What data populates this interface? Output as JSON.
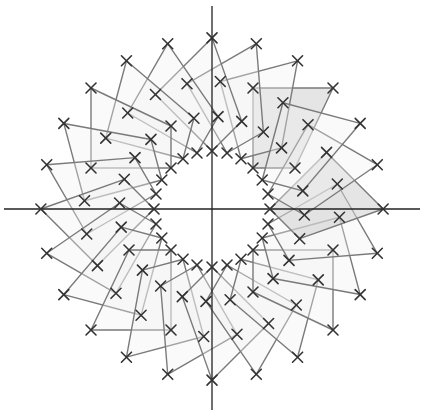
{
  "figure": {
    "origin_px": [
      212,
      209
    ],
    "axes": {
      "x_axis": {
        "from": [
          4,
          209
        ],
        "to": [
          420,
          209
        ]
      },
      "y_axis": {
        "from": [
          212,
          6
        ],
        "to": [
          212,
          410
        ]
      }
    },
    "base_shape": {
      "vertices": [
        [
          41,
          41
        ],
        [
          83,
          41
        ],
        [
          121,
          121
        ],
        [
          41,
          121
        ]
      ]
    },
    "rotation": {
      "copies": 24,
      "step_degrees": 15
    },
    "highlighted_copies": [
      0,
      21
    ],
    "colors": {
      "axis": "#222222",
      "edge": "#7a7a7a",
      "marker": "#333333",
      "fill": "#f1f1f1",
      "fill_opacity": 0.35,
      "highlight_fill": "#cfcfcf",
      "highlight_opacity": 0.55
    },
    "marker_size": 5
  }
}
